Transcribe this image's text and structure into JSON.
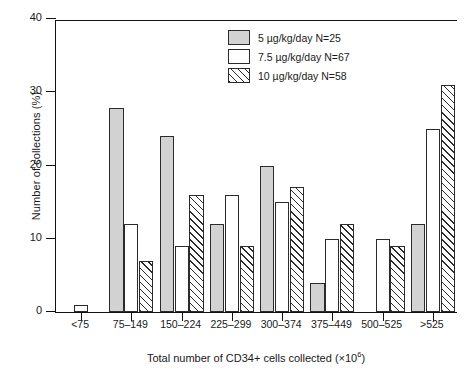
{
  "chart_data": {
    "type": "bar",
    "title": "",
    "xlabel": "Total number of CD34+ cells collected (×10⁶)",
    "xlabel_main": "Total number of CD34+ cells collected (×10",
    "xlabel_sup": "6",
    "xlabel_tail": ")",
    "ylabel": "Number of collections (%)",
    "ylim": [
      0,
      40
    ],
    "yticks": [
      0,
      10,
      20,
      30,
      40
    ],
    "ytick_labels": [
      "0",
      "10",
      "20",
      "30",
      "40"
    ],
    "grid": false,
    "legend_position": "top-right",
    "categories": [
      "<75",
      "75–149",
      "150–224",
      "225–299",
      "300–374",
      "375–449",
      "500–525",
      ">525"
    ],
    "series": [
      {
        "name": "5 µg/kg/day N=25",
        "fill": "gray",
        "color": "#d2d2d2",
        "values": [
          null,
          27.8,
          24,
          12,
          20,
          4,
          null,
          12
        ]
      },
      {
        "name": "7.5 µg/kg/day N=67",
        "fill": "white",
        "color": "#ffffff",
        "values": [
          1,
          12,
          9,
          16,
          15,
          10,
          10,
          25
        ]
      },
      {
        "name": "10 µg/kg/day N=58",
        "fill": "hatch",
        "color": "#ffffff",
        "values": [
          null,
          7,
          16,
          9,
          17,
          12,
          9,
          31
        ]
      }
    ]
  },
  "legend": {
    "items": [
      {
        "label": "5 µg/kg/day N=25",
        "fill": "gray"
      },
      {
        "label": "7.5 µg/kg/day N=67",
        "fill": "white"
      },
      {
        "label": "10 µg/kg/day N=58",
        "fill": "hatch"
      }
    ]
  },
  "colors": {
    "axis": "#111111",
    "bar_outline": "#2b2b2b",
    "gray_fill": "#d2d2d2",
    "background": "#ffffff"
  }
}
